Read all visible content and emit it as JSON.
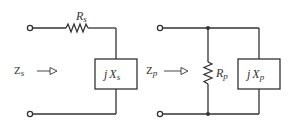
{
  "diagram": {
    "type": "circuit",
    "colors": {
      "wire": "#333333",
      "background": "#ffffff"
    },
    "series_circuit": {
      "resistor": {
        "symbol": "R",
        "subscript": "s"
      },
      "reactance": {
        "prefix": "j",
        "symbol": "X",
        "subscript": "s"
      },
      "impedance": {
        "symbol": "Z",
        "subscript": "s"
      }
    },
    "parallel_circuit": {
      "resistor": {
        "symbol": "R",
        "subscript": "p"
      },
      "reactance": {
        "prefix": "j",
        "symbol": "X",
        "subscript": "p"
      },
      "impedance": {
        "symbol": "Z",
        "subscript": "p"
      }
    }
  }
}
